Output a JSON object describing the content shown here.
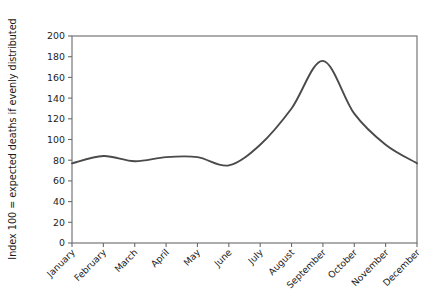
{
  "chart_data": {
    "type": "line",
    "title": "",
    "xlabel": "",
    "ylabel": "Index 100 = expected deaths if evenly distributed",
    "ylim": [
      0,
      200
    ],
    "ytick_labels": [
      "0",
      "20",
      "40",
      "60",
      "80",
      "100",
      "120",
      "140",
      "160",
      "180",
      "200"
    ],
    "ytick_values": [
      0,
      20,
      40,
      60,
      80,
      100,
      120,
      140,
      160,
      180,
      200
    ],
    "grid": false,
    "legend": "none",
    "line_color": "#4a4a4a",
    "axis_color": "#6b6b6b",
    "background_color": "#ffffff",
    "categories": [
      "January",
      "February",
      "March",
      "April",
      "May",
      "June",
      "July",
      "August",
      "September",
      "October",
      "November",
      "December"
    ],
    "values": [
      77,
      84,
      79,
      83,
      83,
      75,
      95,
      130,
      176,
      125,
      95,
      77
    ]
  }
}
